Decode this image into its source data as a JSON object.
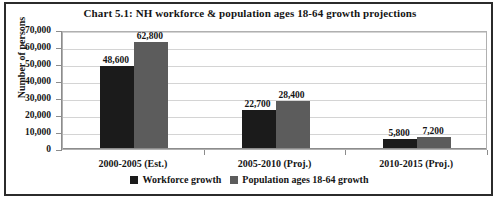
{
  "chart_data": {
    "type": "bar",
    "title": "Chart 5.1: NH workforce & population ages 18-64 growth projections",
    "xlabel": "",
    "ylabel": "Number of persons",
    "ylim": [
      0,
      70000
    ],
    "ytick_step": 10000,
    "ytick_labels": [
      "70,000",
      "60,000",
      "50,000",
      "40,000",
      "30,000",
      "20,000",
      "10,000",
      "0"
    ],
    "ytick_values": [
      70000,
      60000,
      50000,
      40000,
      30000,
      20000,
      10000,
      0
    ],
    "grid": true,
    "legend_position": "bottom",
    "categories": [
      "2000-2005 (Est.)",
      "2005-2010 (Proj.)",
      "2010-2015 (Proj.)"
    ],
    "series": [
      {
        "name": "Workforce growth",
        "color": "#1b1b1b",
        "values": [
          48600,
          22700,
          5800
        ],
        "labels": [
          "48,600",
          "22,700",
          "5,800"
        ]
      },
      {
        "name": "Population ages 18-64 growth",
        "color": "#5c5c5c",
        "values": [
          62800,
          28400,
          7200
        ],
        "labels": [
          "62,800",
          "28,400",
          "7,200"
        ]
      }
    ]
  }
}
